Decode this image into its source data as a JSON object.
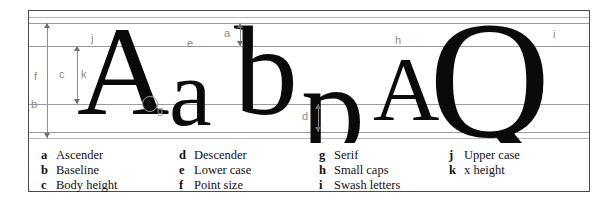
{
  "figure": {
    "kind": "typography-anatomy-diagram",
    "specimen_text": "A a b p A Q",
    "glyphs": [
      {
        "id": "cap-a",
        "char": "A",
        "role": "upper case"
      },
      {
        "id": "lower-a",
        "char": "a",
        "role": "lower case"
      },
      {
        "id": "lower-b",
        "char": "b",
        "role": "ascender"
      },
      {
        "id": "lower-p",
        "char": "p",
        "role": "descender"
      },
      {
        "id": "smallcap-a",
        "char": "A",
        "role": "small caps"
      },
      {
        "id": "swash-q",
        "char": "Q",
        "role": "swash letters"
      }
    ],
    "callouts": [
      {
        "key": "j",
        "target": "upper case"
      },
      {
        "key": "e",
        "target": "lower case"
      },
      {
        "key": "g",
        "target": "serif"
      },
      {
        "key": "h",
        "target": "small caps"
      },
      {
        "key": "i",
        "target": "swash letters"
      },
      {
        "key": "b",
        "target": "baseline"
      },
      {
        "key": "f",
        "target": "point size"
      },
      {
        "key": "c",
        "target": "body height"
      },
      {
        "key": "k",
        "target": "x height"
      },
      {
        "key": "a",
        "target": "ascender"
      },
      {
        "key": "d",
        "target": "descender"
      }
    ]
  },
  "legend": {
    "columns": [
      {
        "items": [
          {
            "key": "a",
            "label": "Ascender"
          },
          {
            "key": "b",
            "label": "Baseline"
          },
          {
            "key": "c",
            "label": "Body height"
          }
        ]
      },
      {
        "items": [
          {
            "key": "d",
            "label": "Descender"
          },
          {
            "key": "e",
            "label": "Lower case"
          },
          {
            "key": "f",
            "label": "Point size"
          }
        ]
      },
      {
        "items": [
          {
            "key": "g",
            "label": "Serif"
          },
          {
            "key": "h",
            "label": "Small caps"
          },
          {
            "key": "i",
            "label": "Swash letters"
          }
        ]
      },
      {
        "items": [
          {
            "key": "j",
            "label": "Upper case"
          },
          {
            "key": "k",
            "label": "x height"
          }
        ]
      }
    ]
  },
  "colors": {
    "frame": "#4a4a4a",
    "guide_line": "#9b9b9b",
    "arrow": "#8d8d8d",
    "callout_text": "#8a8a8a",
    "glyph": "#0a0a0a",
    "background": "#ffffff"
  }
}
